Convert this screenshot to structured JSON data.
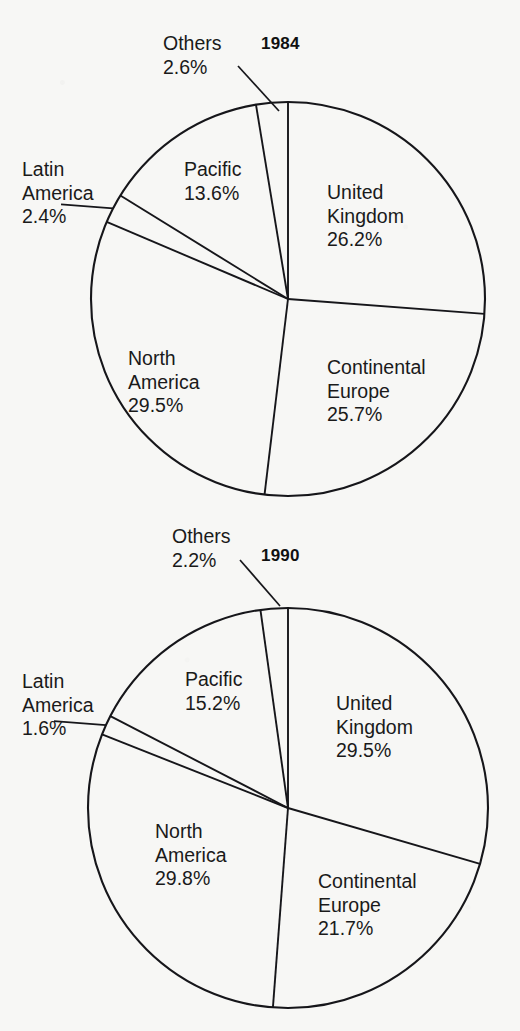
{
  "page": {
    "background_color": "#f7f7f5",
    "ink_color": "#16161a"
  },
  "chart_data": [
    {
      "type": "pie",
      "title": "1984",
      "xlabel": "",
      "ylabel": "",
      "units": "percent",
      "categories": [
        "United Kingdom",
        "Continental Europe",
        "North America",
        "Latin America",
        "Pacific",
        "Others"
      ],
      "values": [
        26.2,
        25.7,
        29.5,
        2.4,
        13.6,
        2.6
      ],
      "labels": [
        {
          "name": "United Kingdom",
          "value": "26.2%",
          "name_line1": "United",
          "name_line2": "Kingdom",
          "placement": "inside"
        },
        {
          "name": "Continental Europe",
          "value": "25.7%",
          "name_line1": "Continental",
          "name_line2": "Europe",
          "placement": "inside"
        },
        {
          "name": "North America",
          "value": "29.5%",
          "name_line1": "North",
          "name_line2": "America",
          "placement": "inside"
        },
        {
          "name": "Latin America",
          "value": "2.4%",
          "name_line1": "Latin",
          "name_line2": "America",
          "placement": "outside-left"
        },
        {
          "name": "Pacific",
          "value": "13.6%",
          "name_line1": "Pacific",
          "name_line2": "",
          "placement": "inside"
        },
        {
          "name": "Others",
          "value": "2.6%",
          "name_line1": "Others",
          "name_line2": "",
          "placement": "outside-top"
        }
      ],
      "legend": "none",
      "grid": false
    },
    {
      "type": "pie",
      "title": "1990",
      "xlabel": "",
      "ylabel": "",
      "units": "percent",
      "categories": [
        "United Kingdom",
        "Continental Europe",
        "North America",
        "Latin America",
        "Pacific",
        "Others"
      ],
      "values": [
        29.5,
        21.7,
        29.8,
        1.6,
        15.2,
        2.2
      ],
      "labels": [
        {
          "name": "United Kingdom",
          "value": "29.5%",
          "name_line1": "United",
          "name_line2": "Kingdom",
          "placement": "inside"
        },
        {
          "name": "Continental Europe",
          "value": "21.7%",
          "name_line1": "Continental",
          "name_line2": "Europe",
          "placement": "inside"
        },
        {
          "name": "North America",
          "value": "29.8%",
          "name_line1": "North",
          "name_line2": "America",
          "placement": "inside"
        },
        {
          "name": "Latin America",
          "value": "1.6%",
          "name_line1": "Latin",
          "name_line2": "America",
          "placement": "outside-left"
        },
        {
          "name": "Pacific",
          "value": "15.2%",
          "name_line1": "Pacific",
          "name_line2": "",
          "placement": "inside"
        },
        {
          "name": "Others",
          "value": "2.2%",
          "name_line1": "Others",
          "name_line2": "",
          "placement": "outside-top"
        }
      ],
      "legend": "none",
      "grid": false
    }
  ],
  "charts": [
    {
      "id": "1984",
      "title": "1984",
      "title_pos": {
        "left": 261,
        "top": 34
      },
      "geometry": {
        "cx": 288,
        "cy": 299,
        "r": 197
      },
      "start_angle": -90,
      "leader": {
        "x1": 238,
        "y1": 66,
        "x2": 279,
        "y2": 111
      },
      "label_positions": [
        {
          "key": "uk",
          "left": 327,
          "top": 181
        },
        {
          "key": "europe",
          "left": 327,
          "top": 356
        },
        {
          "key": "namerica",
          "left": 128,
          "top": 347
        },
        {
          "key": "latin",
          "left": 22,
          "top": 158
        },
        {
          "key": "pacific",
          "left": 184,
          "top": 158
        },
        {
          "key": "others",
          "left": 163,
          "top": 32
        }
      ]
    },
    {
      "id": "1990",
      "title": "1990",
      "title_pos": {
        "left": 261,
        "top": 26
      },
      "geometry": {
        "cx": 288,
        "cy": 288,
        "r": 200
      },
      "start_angle": -90,
      "leader": {
        "x1": 240,
        "y1": 40,
        "x2": 280,
        "y2": 86
      },
      "label_positions": [
        {
          "key": "uk",
          "left": 336,
          "top": 172
        },
        {
          "key": "europe",
          "left": 318,
          "top": 350
        },
        {
          "key": "namerica",
          "left": 155,
          "top": 300
        },
        {
          "key": "latin",
          "left": 22,
          "top": 150
        },
        {
          "key": "pacific",
          "left": 185,
          "top": 148
        },
        {
          "key": "others",
          "left": 172,
          "top": 5
        }
      ]
    }
  ]
}
